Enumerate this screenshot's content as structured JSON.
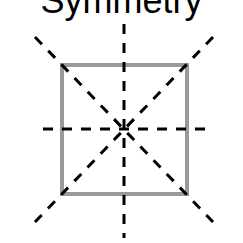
{
  "title": "Symmetry",
  "diagram": {
    "shape": "square",
    "shape_color": "#999999",
    "line_color": "#000000",
    "lines_of_symmetry": 4,
    "lines": [
      "vertical",
      "horizontal",
      "diagonal-main",
      "diagonal-anti"
    ]
  }
}
